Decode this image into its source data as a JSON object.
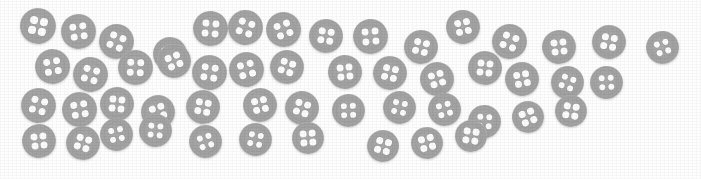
{
  "scene": {
    "title": "scattered four-hole buttons",
    "width": 701,
    "height": 179,
    "background_color": "#fefefe",
    "object_name": "button",
    "object_count": 50,
    "holes_per_button": 4,
    "colors": {
      "button_body": "#a3a3a3",
      "button_rim": "#9a9a9a",
      "button_face": "#a8a8a8",
      "hole": "#fcfcfc",
      "shadow": "#d8d8d8",
      "background": "#fefefe"
    }
  },
  "buttons": [
    {
      "id": 1,
      "x": 20,
      "y": 8,
      "d": 36,
      "rot": 12
    },
    {
      "id": 2,
      "x": 61,
      "y": 14,
      "d": 35,
      "rot": -8
    },
    {
      "id": 3,
      "x": 99,
      "y": 24,
      "d": 35,
      "rot": 22
    },
    {
      "id": 4,
      "x": 153,
      "y": 37,
      "d": 34,
      "rot": -15
    },
    {
      "id": 5,
      "x": 193,
      "y": 11,
      "d": 35,
      "rot": 5
    },
    {
      "id": 6,
      "x": 228,
      "y": 10,
      "d": 35,
      "rot": 18
    },
    {
      "id": 7,
      "x": 266,
      "y": 12,
      "d": 35,
      "rot": -20
    },
    {
      "id": 8,
      "x": 309,
      "y": 19,
      "d": 34,
      "rot": 9
    },
    {
      "id": 9,
      "x": 353,
      "y": 19,
      "d": 35,
      "rot": -5
    },
    {
      "id": 10,
      "x": 404,
      "y": 30,
      "d": 34,
      "rot": 14
    },
    {
      "id": 11,
      "x": 446,
      "y": 10,
      "d": 34,
      "rot": -12
    },
    {
      "id": 12,
      "x": 492,
      "y": 24,
      "d": 35,
      "rot": 20
    },
    {
      "id": 13,
      "x": 542,
      "y": 30,
      "d": 34,
      "rot": -7
    },
    {
      "id": 14,
      "x": 592,
      "y": 25,
      "d": 34,
      "rot": 11
    },
    {
      "id": 15,
      "x": 646,
      "y": 31,
      "d": 33,
      "rot": -18
    },
    {
      "id": 16,
      "x": 35,
      "y": 49,
      "d": 35,
      "rot": -10
    },
    {
      "id": 17,
      "x": 73,
      "y": 57,
      "d": 35,
      "rot": 16
    },
    {
      "id": 18,
      "x": 118,
      "y": 50,
      "d": 35,
      "rot": 3
    },
    {
      "id": 19,
      "x": 157,
      "y": 44,
      "d": 34,
      "rot": -22
    },
    {
      "id": 20,
      "x": 192,
      "y": 55,
      "d": 35,
      "rot": 8
    },
    {
      "id": 21,
      "x": 229,
      "y": 52,
      "d": 35,
      "rot": -14
    },
    {
      "id": 22,
      "x": 270,
      "y": 50,
      "d": 34,
      "rot": 19
    },
    {
      "id": 23,
      "x": 328,
      "y": 55,
      "d": 34,
      "rot": -6
    },
    {
      "id": 24,
      "x": 373,
      "y": 56,
      "d": 34,
      "rot": 13
    },
    {
      "id": 25,
      "x": 420,
      "y": 62,
      "d": 34,
      "rot": -17
    },
    {
      "id": 26,
      "x": 468,
      "y": 51,
      "d": 34,
      "rot": 7
    },
    {
      "id": 27,
      "x": 505,
      "y": 62,
      "d": 34,
      "rot": -11
    },
    {
      "id": 28,
      "x": 551,
      "y": 66,
      "d": 33,
      "rot": 21
    },
    {
      "id": 29,
      "x": 590,
      "y": 66,
      "d": 33,
      "rot": -4
    },
    {
      "id": 30,
      "x": 21,
      "y": 88,
      "d": 35,
      "rot": 15
    },
    {
      "id": 31,
      "x": 62,
      "y": 92,
      "d": 35,
      "rot": -9
    },
    {
      "id": 32,
      "x": 100,
      "y": 87,
      "d": 34,
      "rot": 6
    },
    {
      "id": 33,
      "x": 141,
      "y": 95,
      "d": 34,
      "rot": -19
    },
    {
      "id": 34,
      "x": 186,
      "y": 90,
      "d": 34,
      "rot": 10
    },
    {
      "id": 35,
      "x": 243,
      "y": 88,
      "d": 34,
      "rot": -13
    },
    {
      "id": 36,
      "x": 285,
      "y": 91,
      "d": 34,
      "rot": 17
    },
    {
      "id": 37,
      "x": 332,
      "y": 94,
      "d": 33,
      "rot": -2
    },
    {
      "id": 38,
      "x": 383,
      "y": 91,
      "d": 33,
      "rot": 12
    },
    {
      "id": 39,
      "x": 428,
      "y": 93,
      "d": 33,
      "rot": -16
    },
    {
      "id": 40,
      "x": 468,
      "y": 105,
      "d": 33,
      "rot": 4
    },
    {
      "id": 41,
      "x": 512,
      "y": 101,
      "d": 32,
      "rot": -21
    },
    {
      "id": 42,
      "x": 555,
      "y": 95,
      "d": 32,
      "rot": 9
    },
    {
      "id": 43,
      "x": 22,
      "y": 124,
      "d": 34,
      "rot": -7
    },
    {
      "id": 44,
      "x": 66,
      "y": 126,
      "d": 34,
      "rot": 18
    },
    {
      "id": 45,
      "x": 100,
      "y": 118,
      "d": 33,
      "rot": -12
    },
    {
      "id": 46,
      "x": 139,
      "y": 114,
      "d": 33,
      "rot": 5
    },
    {
      "id": 47,
      "x": 189,
      "y": 125,
      "d": 33,
      "rot": -18
    },
    {
      "id": 48,
      "x": 239,
      "y": 123,
      "d": 33,
      "rot": 11
    },
    {
      "id": 49,
      "x": 292,
      "y": 122,
      "d": 32,
      "rot": -5
    },
    {
      "id": 50,
      "x": 367,
      "y": 130,
      "d": 32,
      "rot": 14
    },
    {
      "id": 51,
      "x": 411,
      "y": 127,
      "d": 32,
      "rot": -15
    },
    {
      "id": 52,
      "x": 455,
      "y": 120,
      "d": 32,
      "rot": 8
    }
  ]
}
